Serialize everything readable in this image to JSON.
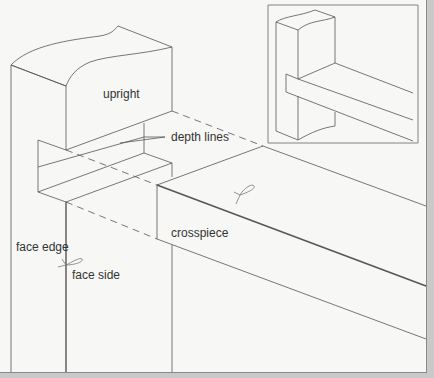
{
  "diagram": {
    "type": "woodworking-joint-illustration",
    "labels": {
      "upright": "upright",
      "depth_lines": "depth lines",
      "crosspiece": "crosspiece",
      "face_edge": "face edge",
      "face_side": "face side"
    },
    "inset": {
      "description": "assembled housing joint view"
    },
    "colors": {
      "background": "#f7f7f5",
      "line": "#555555",
      "frame": "#8a8a8a"
    }
  }
}
